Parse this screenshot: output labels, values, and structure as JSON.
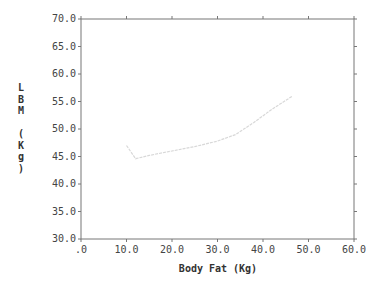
{
  "chart_data": {
    "type": "line",
    "title": "",
    "xlabel": "Body Fat (Kg)",
    "ylabel": "LBM (Kg)",
    "ylabel_chars": [
      "L",
      "B",
      "M",
      "",
      "(",
      "K",
      "g",
      ")"
    ],
    "xlim": [
      0,
      60
    ],
    "ylim": [
      30,
      70
    ],
    "x_ticks": [
      ".0",
      "10.0",
      "20.0",
      "30.0",
      "40.0",
      "50.0",
      "60.0"
    ],
    "x_tick_values": [
      0,
      10,
      20,
      30,
      40,
      50,
      60
    ],
    "y_ticks": [
      "30.0",
      "35.0",
      "40.0",
      "45.0",
      "50.0",
      "55.0",
      "60.0",
      "65.0",
      "70.0"
    ],
    "y_tick_values": [
      30,
      35,
      40,
      45,
      50,
      55,
      60,
      65,
      70
    ],
    "grid": false,
    "legend": null,
    "series": [
      {
        "name": "LBM vs Body Fat",
        "color": "#d8d8d8",
        "x": [
          10.0,
          11.0,
          12.0,
          15.0,
          20.0,
          25.0,
          30.0,
          34.0,
          38.0,
          42.0,
          46.5
        ],
        "y": [
          47.0,
          45.8,
          44.6,
          45.2,
          46.0,
          46.8,
          47.8,
          49.0,
          51.2,
          53.6,
          56.0
        ]
      }
    ]
  }
}
